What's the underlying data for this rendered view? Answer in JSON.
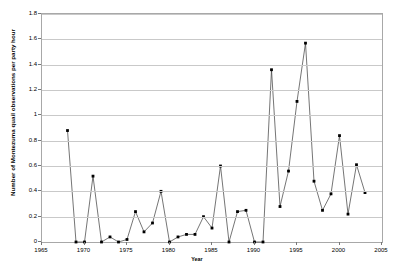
{
  "chart_data": {
    "type": "line",
    "title": "",
    "xlabel": "Year",
    "ylabel": "Number of Montezuma quail observations per party hour",
    "xlim": [
      1965,
      2005
    ],
    "ylim": [
      0,
      1.8
    ],
    "grid": true,
    "legend": "none",
    "marker": "filled-square",
    "line_color": "#3a3a3a",
    "marker_color": "#000000",
    "grid_color": "#c9c9c9",
    "xticks": [
      1965,
      1970,
      1975,
      1980,
      1985,
      1990,
      1995,
      2000,
      2005
    ],
    "xtick_labels": [
      "1965",
      "1970",
      "1975",
      "1980",
      "1985",
      "1990",
      "1995",
      "2000",
      "2005"
    ],
    "yticks": [
      0,
      0.2,
      0.4,
      0.6,
      0.8,
      1,
      1.2,
      1.4,
      1.6,
      1.8
    ],
    "ytick_labels": [
      "0",
      "0.2",
      "0.4",
      "0.6",
      "0.8",
      "1",
      "1.2",
      "1.4",
      "1.6",
      "1.8"
    ],
    "x": [
      1968,
      1969,
      1970,
      1971,
      1972,
      1973,
      1974,
      1975,
      1976,
      1977,
      1978,
      1979,
      1980,
      1981,
      1982,
      1983,
      1984,
      1985,
      1986,
      1987,
      1988,
      1989,
      1990,
      1991,
      1992,
      1993,
      1994,
      1995,
      1996,
      1997,
      1998,
      1999,
      2000,
      2001,
      2002,
      2003
    ],
    "values": [
      0.88,
      0.0,
      0.0,
      0.52,
      0.0,
      0.04,
      0.0,
      0.02,
      0.24,
      0.08,
      0.15,
      0.4,
      0.0,
      0.04,
      0.06,
      0.06,
      0.2,
      0.11,
      0.6,
      0.0,
      0.24,
      0.25,
      0.0,
      0.0,
      1.36,
      0.28,
      0.56,
      1.11,
      1.57,
      0.48,
      0.25,
      0.38,
      0.84,
      0.22,
      0.61,
      0.39
    ],
    "series_name": "Montezuma quail observations per party hour"
  }
}
